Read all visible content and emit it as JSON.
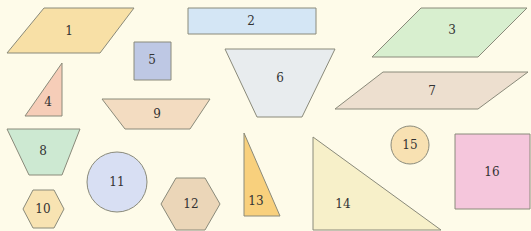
{
  "diagram": {
    "background": "#fefbe9",
    "stroke": "#8a8a7a",
    "shapes": [
      {
        "id": "1",
        "label": "1",
        "type": "parallelogram",
        "fill": "#f8e0a6",
        "points": "44,8 134,8 100,53 7,53",
        "tx": 69,
        "ty": 35
      },
      {
        "id": "2",
        "label": "2",
        "type": "rectangle",
        "fill": "#d4e6f5",
        "points": "188,8 316,8 316,34 188,34",
        "tx": 251,
        "ty": 25
      },
      {
        "id": "3",
        "label": "3",
        "type": "parallelogram",
        "fill": "#d8efcf",
        "points": "421,8 527,8 478,57 372,57",
        "tx": 452,
        "ty": 34
      },
      {
        "id": "4",
        "label": "4",
        "type": "right-triangle",
        "fill": "#f6cdb8",
        "points": "62,63 62,116 25,116",
        "tx": 48,
        "ty": 106
      },
      {
        "id": "5",
        "label": "5",
        "type": "square",
        "fill": "#bec8e4",
        "points": "134,42 171,42 171,80 134,80",
        "tx": 152,
        "ty": 64
      },
      {
        "id": "6",
        "label": "6",
        "type": "trapezoid",
        "fill": "#e8ecee",
        "points": "225,49 335,49 302,117 257,117",
        "tx": 280,
        "ty": 82
      },
      {
        "id": "7",
        "label": "7",
        "type": "parallelogram",
        "fill": "#eddfcf",
        "points": "383,72 528,72 478,109 335,109",
        "tx": 432,
        "ty": 95
      },
      {
        "id": "8",
        "label": "8",
        "type": "trapezoid",
        "fill": "#cde9d2",
        "points": "7,129 80,129 62,175 29,175",
        "tx": 43,
        "ty": 155
      },
      {
        "id": "9",
        "label": "9",
        "type": "trapezoid",
        "fill": "#f3dcc1",
        "points": "102,99 210,99 190,129 125,129",
        "tx": 157,
        "ty": 118
      },
      {
        "id": "10",
        "label": "10",
        "type": "hexagon",
        "fill": "#f8e3b2",
        "points": "33,190 54,190 64,209 54,228 33,228 23,209",
        "tx": 43,
        "ty": 213
      },
      {
        "id": "11",
        "label": "11",
        "type": "circle",
        "fill": "#d8dff3",
        "cx": 117,
        "cy": 182,
        "r": 30,
        "tx": 117,
        "ty": 186
      },
      {
        "id": "12",
        "label": "12",
        "type": "hexagon",
        "fill": "#ebd6b8",
        "points": "176,178 205,178 220,204 205,230 176,230 161,204",
        "tx": 191,
        "ty": 208
      },
      {
        "id": "13",
        "label": "13",
        "type": "right-triangle",
        "fill": "#f8d07d",
        "points": "244,133 280,216 244,216",
        "tx": 256,
        "ty": 205
      },
      {
        "id": "14",
        "label": "14",
        "type": "right-triangle",
        "fill": "#f7f0c9",
        "points": "313,137 441,230 313,230",
        "tx": 343,
        "ty": 208
      },
      {
        "id": "15",
        "label": "15",
        "type": "circle",
        "fill": "#f8e1b2",
        "cx": 410,
        "cy": 145,
        "r": 19,
        "tx": 410,
        "ty": 149
      },
      {
        "id": "16",
        "label": "16",
        "type": "square",
        "fill": "#f5c6dc",
        "points": "455,134 530,134 530,209 455,209",
        "tx": 492,
        "ty": 176
      }
    ]
  }
}
